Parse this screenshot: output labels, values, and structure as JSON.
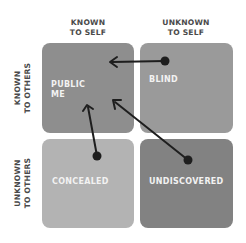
{
  "columns": {
    "known_to_self": [
      "KNOWN",
      "TO SELF"
    ],
    "unknown_to_self": [
      "UNKNOWN",
      "TO SELF"
    ]
  },
  "rows": {
    "known_to_others": [
      "KNOWN",
      "TO OTHERS"
    ],
    "unknown_to_others": [
      "UNKNOWN",
      "TO OTHERS"
    ]
  },
  "quadrants": {
    "public": {
      "label_lines": [
        "PUBLIC",
        "ME"
      ],
      "color": "#8e8e8e"
    },
    "blind": {
      "label": "BLIND",
      "color": "#9a9a9a"
    },
    "concealed": {
      "label": "CONCEALED",
      "color": "#b3b3b3"
    },
    "undiscovered": {
      "label": "UNDISCOVERED",
      "color": "#828282"
    }
  },
  "arrows": [
    {
      "from": "blind",
      "to": "public"
    },
    {
      "from": "concealed",
      "to": "public"
    },
    {
      "from": "undiscovered",
      "to": "public"
    }
  ],
  "arrow_color": "#1e1e1e"
}
